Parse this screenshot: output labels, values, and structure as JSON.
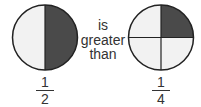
{
  "comparison_text": [
    "is",
    "greater",
    "than"
  ],
  "left_fraction": {
    "numerator": "1",
    "denominator": "2",
    "parts": 2,
    "shaded": 1
  },
  "right_fraction": {
    "numerator": "1",
    "denominator": "4",
    "parts": 4,
    "shaded": 1
  },
  "colors": {
    "shaded": "#4a4a4a",
    "unshaded": "#f2f2f2",
    "outline": "#222222"
  }
}
